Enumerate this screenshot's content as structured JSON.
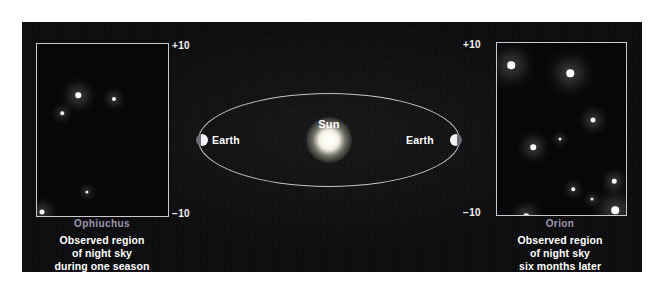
{
  "figure": {
    "background_color": "#0a0a0c",
    "accent_color": "#c9c9cf",
    "constellation_label_color": "#9b96ac"
  },
  "center_diagram": {
    "sun_label": "Sun",
    "earth_label_left": "Earth",
    "earth_label_right": "Earth",
    "orbit_shape": "ellipse"
  },
  "left_panel": {
    "scale_top": "+10",
    "scale_bottom": "−10",
    "constellation": "Ophiuchus",
    "caption_line1": "Observed region",
    "caption_line2": "of night sky",
    "caption_line3": "during one season",
    "stars": [
      {
        "x": 41,
        "y": 51,
        "size": 5.5,
        "brightness": 1.0
      },
      {
        "x": 77,
        "y": 55,
        "size": 4.0,
        "brightness": 0.9
      },
      {
        "x": 25,
        "y": 69,
        "size": 3.5,
        "brightness": 0.82
      },
      {
        "x": 50,
        "y": 148,
        "size": 3.2,
        "brightness": 0.78
      },
      {
        "x": 5,
        "y": 168,
        "size": 5.0,
        "brightness": 0.95
      }
    ]
  },
  "right_panel": {
    "scale_top": "+10",
    "scale_bottom": "−10",
    "constellation": "Orion",
    "caption_line1": "Observed region",
    "caption_line2": "of night sky",
    "caption_line3": "six months later",
    "stars": [
      {
        "x": 14,
        "y": 22,
        "size": 7.5,
        "brightness": 1.0
      },
      {
        "x": 73,
        "y": 30,
        "size": 7.5,
        "brightness": 1.0
      },
      {
        "x": 96,
        "y": 77,
        "size": 5.0,
        "brightness": 0.92
      },
      {
        "x": 63,
        "y": 96,
        "size": 3.0,
        "brightness": 0.75
      },
      {
        "x": 36,
        "y": 104,
        "size": 5.5,
        "brightness": 0.95
      },
      {
        "x": 117,
        "y": 138,
        "size": 4.5,
        "brightness": 0.9
      },
      {
        "x": 76,
        "y": 146,
        "size": 3.5,
        "brightness": 0.8
      },
      {
        "x": 95,
        "y": 156,
        "size": 3.0,
        "brightness": 0.75
      },
      {
        "x": 118,
        "y": 167,
        "size": 7.5,
        "brightness": 1.0
      },
      {
        "x": 29,
        "y": 173,
        "size": 5.5,
        "brightness": 0.95
      }
    ]
  },
  "chart_data": {
    "type": "scatter",
    "xlabel": "",
    "ylabel": "Declination (degrees)",
    "ylim": [
      -10,
      10
    ],
    "grid": false,
    "legend": "none",
    "series": [
      {
        "name": "Ophiuchus (during one season)",
        "points": [
          {
            "x": 41,
            "y": 51
          },
          {
            "x": 77,
            "y": 55
          },
          {
            "x": 25,
            "y": 69
          },
          {
            "x": 50,
            "y": 148
          },
          {
            "x": 5,
            "y": 168
          }
        ]
      },
      {
        "name": "Orion (six months later)",
        "points": [
          {
            "x": 14,
            "y": 22
          },
          {
            "x": 73,
            "y": 30
          },
          {
            "x": 96,
            "y": 77
          },
          {
            "x": 63,
            "y": 96
          },
          {
            "x": 36,
            "y": 104
          },
          {
            "x": 117,
            "y": 138
          },
          {
            "x": 76,
            "y": 146
          },
          {
            "x": 95,
            "y": 156
          },
          {
            "x": 118,
            "y": 167
          },
          {
            "x": 29,
            "y": 173
          }
        ]
      }
    ],
    "annotations": [
      "Sun",
      "Earth",
      "Earth",
      "+10",
      "−10",
      "+10",
      "−10"
    ]
  }
}
